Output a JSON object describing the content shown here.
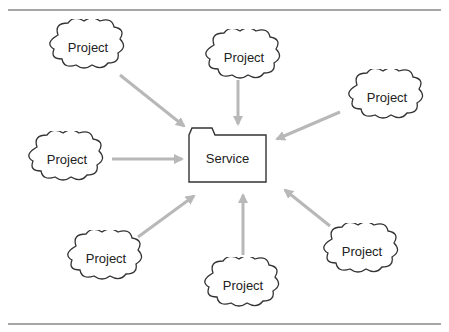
{
  "diagram": {
    "center": {
      "label": "Service",
      "shape": "folder",
      "x": 189,
      "y": 128,
      "w": 77,
      "h": 54
    },
    "projects": [
      {
        "label": "Project",
        "cx": 88,
        "cy": 47
      },
      {
        "label": "Project",
        "cx": 244,
        "cy": 57
      },
      {
        "label": "Project",
        "cx": 387,
        "cy": 97
      },
      {
        "label": "Project",
        "cx": 67,
        "cy": 159
      },
      {
        "label": "Project",
        "cx": 106,
        "cy": 258
      },
      {
        "label": "Project",
        "cx": 243,
        "cy": 285
      },
      {
        "label": "Project",
        "cx": 362,
        "cy": 251
      }
    ],
    "arrow_color": "#b8b8b8",
    "line_color": "#333333"
  }
}
